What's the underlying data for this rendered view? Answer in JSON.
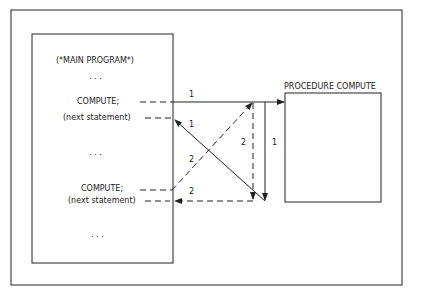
{
  "main_program": {
    "title": "(*MAIN PROGRAM*)",
    "dots_top": ". . .",
    "call_1": "COMPUTE;",
    "next_1": "(next statement)",
    "dots_mid": ". . .",
    "call_2": "COMPUTE;",
    "next_2": "(next statement)",
    "dots_bottom": ". . ."
  },
  "procedure": {
    "title": "PROCEDURE COMPUTE"
  },
  "arrows": {
    "call_1_label": "1",
    "return_1_label": "1",
    "vertical_1_label": "1",
    "call_2_label": "2",
    "vertical_2_label": "2",
    "return_2_label": "2"
  },
  "colors": {
    "line": "#222222",
    "background": "#ffffff"
  }
}
